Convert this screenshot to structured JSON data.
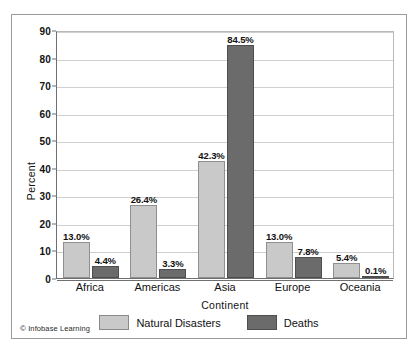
{
  "chart_data": {
    "type": "bar",
    "title": "",
    "xlabel": "Continent",
    "ylabel": "Percent",
    "ylim": [
      0,
      90
    ],
    "yticks": [
      0,
      10,
      20,
      30,
      40,
      50,
      60,
      70,
      80,
      90
    ],
    "grid": "horizontal",
    "legend_position": "bottom-center",
    "categories": [
      "Africa",
      "Americas",
      "Asia",
      "Europe",
      "Oceania"
    ],
    "series": [
      {
        "name": "Natural Disasters",
        "color": "#c9c9c9",
        "values": [
          13.0,
          26.4,
          42.3,
          13.0,
          5.4
        ],
        "labels": [
          "13.0%",
          "26.4%",
          "42.3%",
          "13.0%",
          "5.4%"
        ]
      },
      {
        "name": "Deaths",
        "color": "#6b6b6b",
        "values": [
          4.4,
          3.3,
          84.5,
          7.8,
          0.1
        ],
        "labels": [
          "4.4%",
          "3.3%",
          "84.5%",
          "7.8%",
          "0.1%"
        ]
      }
    ]
  },
  "footer": {
    "copyright_mark": "©",
    "credit": "Infobase Learning"
  },
  "colors": {
    "series_light": "#c9c9c9",
    "series_dark": "#6b6b6b",
    "grid": "#cfcfcf",
    "axis": "#6f6f6f",
    "frame": "#9a9a9a",
    "text": "#111111"
  }
}
